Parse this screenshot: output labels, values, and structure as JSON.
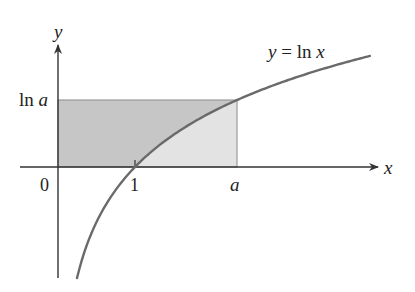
{
  "figure": {
    "type": "function-graph",
    "function": "y = ln x",
    "curve_label": "y = ln x",
    "axis_labels": {
      "x": "x",
      "y": "y"
    },
    "tick_labels": {
      "origin": "0",
      "one": "1",
      "a": "a",
      "ln_a": "ln a"
    },
    "parameters": {
      "a": 2.325
    },
    "regions": [
      {
        "name": "region-above-curve",
        "description": "between y=ln x and y=ln a, x from 0 to a (left of curve)",
        "color": "#c6c6c6"
      },
      {
        "name": "region-below-curve",
        "description": "between x-axis and y=ln x, x from 1 to a",
        "color": "#e3e3e3"
      }
    ],
    "colors": {
      "axis": "#333333",
      "curve": "#6a6a6a",
      "dark_fill": "#c6c6c6",
      "light_fill": "#e3e3e3",
      "rect_edge": "#8a8a8a"
    }
  },
  "geometry": {
    "origin_px": [
      58,
      167
    ],
    "x_scale_px": 77,
    "y_scale_px": 79.4,
    "x_axis": {
      "from": 20,
      "to": 378
    },
    "y_axis": {
      "from": 278,
      "to": 45
    },
    "curve_x_range": [
      0.247,
      4.05
    ]
  }
}
